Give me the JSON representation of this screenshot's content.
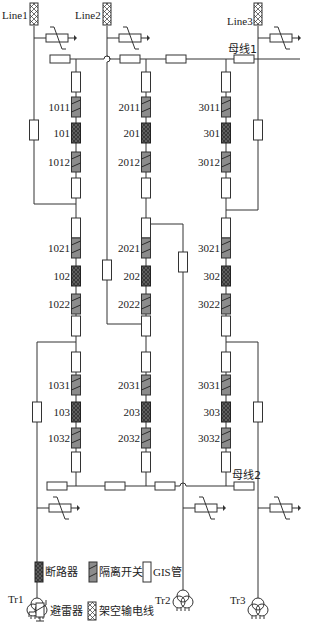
{
  "diagram": {
    "lines": [
      {
        "id": "line1",
        "label": "Line1"
      },
      {
        "id": "line2",
        "label": "Line2"
      },
      {
        "id": "line3",
        "label": "Line3"
      }
    ],
    "buses": [
      {
        "id": "bus1",
        "label": "母线1"
      },
      {
        "id": "bus2",
        "label": "母线2"
      }
    ],
    "transformers": [
      {
        "id": "tr1",
        "label": "Tr1"
      },
      {
        "id": "tr2",
        "label": "Tr2"
      },
      {
        "id": "tr3",
        "label": "Tr3"
      }
    ],
    "strings": [
      {
        "id": "string1",
        "devices": [
          {
            "type": "disconnector",
            "label": "1011"
          },
          {
            "type": "breaker",
            "label": "101"
          },
          {
            "type": "disconnector",
            "label": "1012"
          },
          {
            "type": "disconnector",
            "label": "1021"
          },
          {
            "type": "breaker",
            "label": "102"
          },
          {
            "type": "disconnector",
            "label": "1022"
          },
          {
            "type": "disconnector",
            "label": "1031"
          },
          {
            "type": "breaker",
            "label": "103"
          },
          {
            "type": "disconnector",
            "label": "1032"
          }
        ]
      },
      {
        "id": "string2",
        "devices": [
          {
            "type": "disconnector",
            "label": "2011"
          },
          {
            "type": "breaker",
            "label": "201"
          },
          {
            "type": "disconnector",
            "label": "2012"
          },
          {
            "type": "disconnector",
            "label": "2021"
          },
          {
            "type": "breaker",
            "label": "202"
          },
          {
            "type": "disconnector",
            "label": "2022"
          },
          {
            "type": "disconnector",
            "label": "2031"
          },
          {
            "type": "breaker",
            "label": "203"
          },
          {
            "type": "disconnector",
            "label": "2032"
          }
        ]
      },
      {
        "id": "string3",
        "devices": [
          {
            "type": "disconnector",
            "label": "3011"
          },
          {
            "type": "breaker",
            "label": "301"
          },
          {
            "type": "disconnector",
            "label": "3012"
          },
          {
            "type": "disconnector",
            "label": "3021"
          },
          {
            "type": "breaker",
            "label": "302"
          },
          {
            "type": "disconnector",
            "label": "3022"
          },
          {
            "type": "disconnector",
            "label": "3031"
          },
          {
            "type": "breaker",
            "label": "303"
          },
          {
            "type": "disconnector",
            "label": "3032"
          }
        ]
      }
    ]
  },
  "legend": {
    "breaker": "断路器",
    "disconnector": "隔离开关",
    "gis_pipe": "GIS管",
    "arrester": "避雷器",
    "overhead_line": "架空输电线"
  },
  "colors": {
    "breaker_fill": "#333333",
    "disconnector_fill": "#8c8c8c",
    "wire": "#333333",
    "background": "#ffffff"
  }
}
